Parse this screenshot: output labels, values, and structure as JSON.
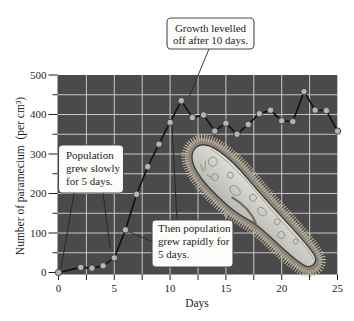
{
  "chart_data": {
    "type": "line",
    "title": "",
    "xlabel": "Days",
    "ylabel": "Number of paramecium  (per cm³)",
    "xlim": [
      0,
      25
    ],
    "ylim": [
      0,
      500
    ],
    "xticks": [
      0,
      5,
      10,
      15,
      20,
      25
    ],
    "yticks": [
      0,
      100,
      200,
      300,
      400,
      500
    ],
    "x_grid_step": 2.5,
    "y_grid_step": 50,
    "grid": true,
    "legend": "none",
    "series": [
      {
        "name": "Paramecium population",
        "x": [
          0,
          2,
          3,
          4,
          5,
          6,
          7,
          8,
          9,
          10,
          11,
          12,
          13,
          14,
          15,
          16,
          17,
          18,
          19,
          20,
          21,
          22,
          23,
          24,
          25
        ],
        "y": [
          0,
          13,
          11,
          17,
          37,
          108,
          198,
          268,
          325,
          380,
          435,
          392,
          399,
          358,
          378,
          350,
          375,
          402,
          411,
          384,
          382,
          458,
          411,
          410,
          358
        ]
      }
    ],
    "annotations": [
      {
        "id": "growth-levelled",
        "lines": [
          "Growth levelled",
          "off after 10 days."
        ]
      },
      {
        "id": "grew-slowly",
        "lines": [
          "Population",
          "grew slowly",
          "for 5 days."
        ]
      },
      {
        "id": "grew-rapidly",
        "lines": [
          "Then population",
          "grew rapidly for",
          "5 days."
        ]
      }
    ]
  },
  "illustration": {
    "subject": "paramecium"
  },
  "colors": {
    "plot_background": "#4a4a4a",
    "grid": "#c6c6c6",
    "line": "#111111",
    "marker_fill": "#b5b5b5",
    "marker_edge": "#3a3a3a"
  }
}
